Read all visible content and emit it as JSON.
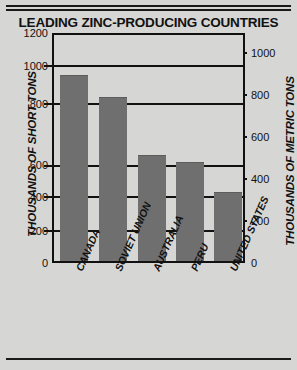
{
  "title": "LEADING ZINC-PRODUCING COUNTRIES",
  "chart_data": {
    "type": "bar",
    "title": "LEADING ZINC-PRODUCING COUNTRIES",
    "xlabel": "",
    "ylabel": "THOUSANDS OF SHORT TONS",
    "y2label": "THOUSANDS OF METRIC TONS",
    "categories": [
      "CANADA",
      "SOVIET UNION",
      "AUSTRALIA",
      "PERU",
      "UNITED STATES"
    ],
    "values": [
      980,
      865,
      560,
      520,
      360
    ],
    "ylim": [
      0,
      1200
    ],
    "yticks": [
      0,
      200,
      400,
      600,
      800,
      1000,
      1200
    ],
    "y2lim": [
      0,
      1088
    ],
    "y2ticks": [
      0,
      200,
      400,
      600,
      800,
      1000
    ],
    "grid": true,
    "legend": "none",
    "bar_color": "#6f6f6f",
    "background_color": "#d6d6d4",
    "axis_color": "#111111"
  },
  "axes": {
    "left_title": "THOUSANDS OF SHORT TONS",
    "right_title": "THOUSANDS OF METRIC TONS",
    "left_ticks": [
      "1200",
      "1000",
      "800",
      "600",
      "400",
      "200",
      "0"
    ],
    "right_ticks": [
      "1000",
      "800",
      "600",
      "400",
      "200",
      "0"
    ]
  },
  "categories": {
    "c0": "CANADA",
    "c1": "SOVIET UNION",
    "c2": "AUSTRALIA",
    "c3": "PERU",
    "c4": "UNITED STATES"
  }
}
